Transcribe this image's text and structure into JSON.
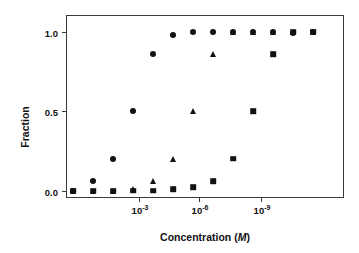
{
  "chart_data": {
    "type": "scatter",
    "title": "",
    "xlabel": "Concentration (M)",
    "xlabel_plain": "Concentration",
    "xlabel_unit": "M",
    "ylabel": "Fraction",
    "x_scale": "log-reversed",
    "xtick_labels": [
      "10",
      "10",
      "10"
    ],
    "xtick_exponents": [
      "-3",
      "-6",
      "-9"
    ],
    "xticks": [
      {
        "label": "10",
        "exponent": "-3",
        "px": 138
      },
      {
        "label": "10",
        "exponent": "-6",
        "px": 198
      },
      {
        "label": "10",
        "exponent": "-9",
        "px": 260
      }
    ],
    "yticks": [
      {
        "label": "0.0",
        "value": 0.0
      },
      {
        "label": "0.5",
        "value": 0.5
      },
      {
        "label": "1.0",
        "value": 1.0
      }
    ],
    "ylim": [
      -0.04,
      1.1
    ],
    "grid": false,
    "legend": "none",
    "marker_color": "#111111",
    "series": [
      {
        "name": "circle-series",
        "marker": "circle",
        "points": [
          {
            "px": 72,
            "y": 0.0
          },
          {
            "px": 92,
            "y": 0.06
          },
          {
            "px": 112,
            "y": 0.2
          },
          {
            "px": 132,
            "y": 0.5
          },
          {
            "px": 152,
            "y": 0.86
          },
          {
            "px": 172,
            "y": 0.98
          },
          {
            "px": 192,
            "y": 1.0
          },
          {
            "px": 212,
            "y": 1.0
          },
          {
            "px": 232,
            "y": 1.0
          },
          {
            "px": 252,
            "y": 1.0
          },
          {
            "px": 272,
            "y": 1.0
          },
          {
            "px": 292,
            "y": 0.99
          },
          {
            "px": 312,
            "y": 1.0
          }
        ]
      },
      {
        "name": "triangle-series",
        "marker": "triangle",
        "points": [
          {
            "px": 72,
            "y": 0.0
          },
          {
            "px": 92,
            "y": 0.0
          },
          {
            "px": 112,
            "y": 0.0
          },
          {
            "px": 132,
            "y": 0.01
          },
          {
            "px": 152,
            "y": 0.06
          },
          {
            "px": 172,
            "y": 0.2
          },
          {
            "px": 192,
            "y": 0.5
          },
          {
            "px": 212,
            "y": 0.86
          },
          {
            "px": 232,
            "y": 1.0
          },
          {
            "px": 252,
            "y": 1.0
          },
          {
            "px": 272,
            "y": 1.0
          },
          {
            "px": 292,
            "y": 1.0
          },
          {
            "px": 312,
            "y": 1.0
          }
        ]
      },
      {
        "name": "square-series",
        "marker": "square",
        "points": [
          {
            "px": 72,
            "y": 0.0
          },
          {
            "px": 92,
            "y": 0.0
          },
          {
            "px": 112,
            "y": 0.0
          },
          {
            "px": 132,
            "y": 0.0
          },
          {
            "px": 152,
            "y": 0.0
          },
          {
            "px": 172,
            "y": 0.01
          },
          {
            "px": 192,
            "y": 0.02
          },
          {
            "px": 212,
            "y": 0.06
          },
          {
            "px": 232,
            "y": 0.2
          },
          {
            "px": 252,
            "y": 0.5
          },
          {
            "px": 272,
            "y": 0.86
          },
          {
            "px": 292,
            "y": 1.0
          },
          {
            "px": 312,
            "y": 1.0
          }
        ]
      }
    ]
  }
}
